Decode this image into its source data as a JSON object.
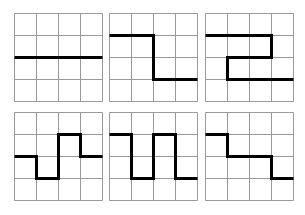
{
  "figure": {
    "grid_size": 4,
    "grid_color": "#9a9a9a",
    "path_color": "#000000",
    "panels": [
      {
        "id": "panel-1",
        "x": 14,
        "y": 13,
        "size": 88,
        "path": [
          [
            0,
            2
          ],
          [
            4,
            2
          ]
        ]
      },
      {
        "id": "panel-2",
        "x": 109,
        "y": 13,
        "size": 88,
        "path": [
          [
            0,
            1
          ],
          [
            2,
            1
          ],
          [
            2,
            3
          ],
          [
            4,
            3
          ]
        ]
      },
      {
        "id": "panel-3",
        "x": 205,
        "y": 13,
        "size": 88,
        "path": [
          [
            0,
            1
          ],
          [
            3,
            1
          ],
          [
            3,
            2
          ],
          [
            1,
            2
          ],
          [
            1,
            3
          ],
          [
            4,
            3
          ]
        ]
      },
      {
        "id": "panel-4",
        "x": 14,
        "y": 112,
        "size": 88,
        "path": [
          [
            0,
            2
          ],
          [
            1,
            2
          ],
          [
            1,
            3
          ],
          [
            2,
            3
          ],
          [
            2,
            1
          ],
          [
            3,
            1
          ],
          [
            3,
            2
          ],
          [
            4,
            2
          ]
        ]
      },
      {
        "id": "panel-5",
        "x": 109,
        "y": 112,
        "size": 88,
        "path": [
          [
            0,
            1
          ],
          [
            1,
            1
          ],
          [
            1,
            3
          ],
          [
            2,
            3
          ],
          [
            2,
            1
          ],
          [
            3,
            1
          ],
          [
            3,
            3
          ],
          [
            4,
            3
          ]
        ]
      },
      {
        "id": "panel-6",
        "x": 205,
        "y": 112,
        "size": 88,
        "path": [
          [
            0,
            1
          ],
          [
            1,
            1
          ],
          [
            1,
            2
          ],
          [
            3,
            2
          ],
          [
            3,
            3
          ],
          [
            4,
            3
          ]
        ]
      }
    ]
  }
}
